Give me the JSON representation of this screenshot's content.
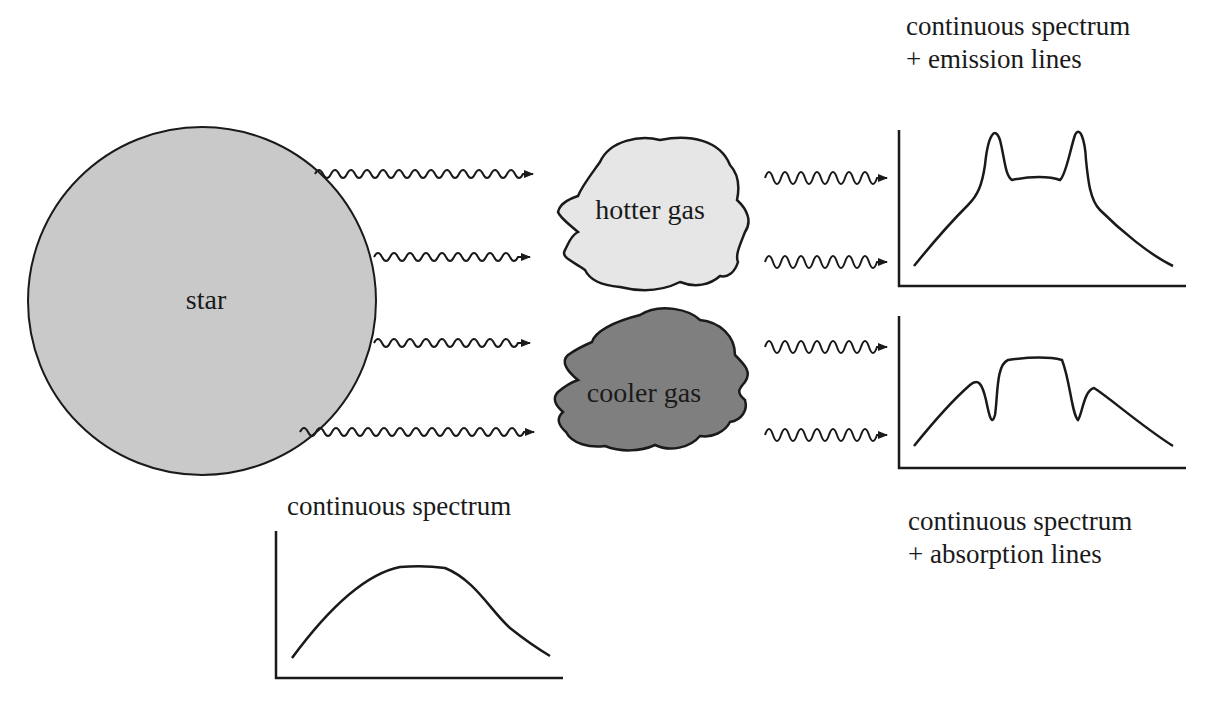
{
  "diagram": {
    "star": {
      "label": "star",
      "fill": "#c9c9c9"
    },
    "hotter_gas": {
      "label": "hotter gas",
      "fill": "#e6e6e6"
    },
    "cooler_gas": {
      "label": "cooler gas",
      "fill": "#7f7f7f"
    },
    "spectra": {
      "continuous": {
        "title": "continuous spectrum"
      },
      "emission": {
        "title_line1": "continuous spectrum",
        "title_line2": "+ emission lines"
      },
      "absorption": {
        "title_line1": "continuous spectrum",
        "title_line2": "+ absorption lines"
      }
    },
    "arrows": [
      {
        "from": "star",
        "to": "hotter gas"
      },
      {
        "from": "star",
        "to": "hotter gas"
      },
      {
        "from": "star",
        "to": "cooler gas"
      },
      {
        "from": "star",
        "to": "cooler gas"
      },
      {
        "from": "hotter gas",
        "to": "emission spectrum"
      },
      {
        "from": "hotter gas",
        "to": "emission spectrum"
      },
      {
        "from": "cooler gas",
        "to": "absorption spectrum"
      },
      {
        "from": "cooler gas",
        "to": "absorption spectrum"
      }
    ]
  }
}
